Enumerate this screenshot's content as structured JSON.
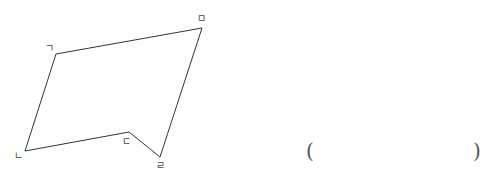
{
  "figure": {
    "type": "pentagon",
    "stroke_color": "#333333",
    "vertices": [
      {
        "label": "ㄱ",
        "x": 56,
        "y": 54,
        "lx": 45,
        "ly": 44
      },
      {
        "label": "ㄴ",
        "x": 25,
        "y": 151,
        "lx": 14,
        "ly": 151
      },
      {
        "label": "ㄷ",
        "x": 129,
        "y": 132,
        "lx": 122,
        "ly": 137
      },
      {
        "label": "ㄹ",
        "x": 160,
        "y": 157,
        "lx": 156,
        "ly": 161
      },
      {
        "label": "ㅁ",
        "x": 202,
        "y": 28,
        "lx": 197,
        "ly": 14
      }
    ]
  },
  "answer": {
    "open": "(",
    "close": ")"
  }
}
